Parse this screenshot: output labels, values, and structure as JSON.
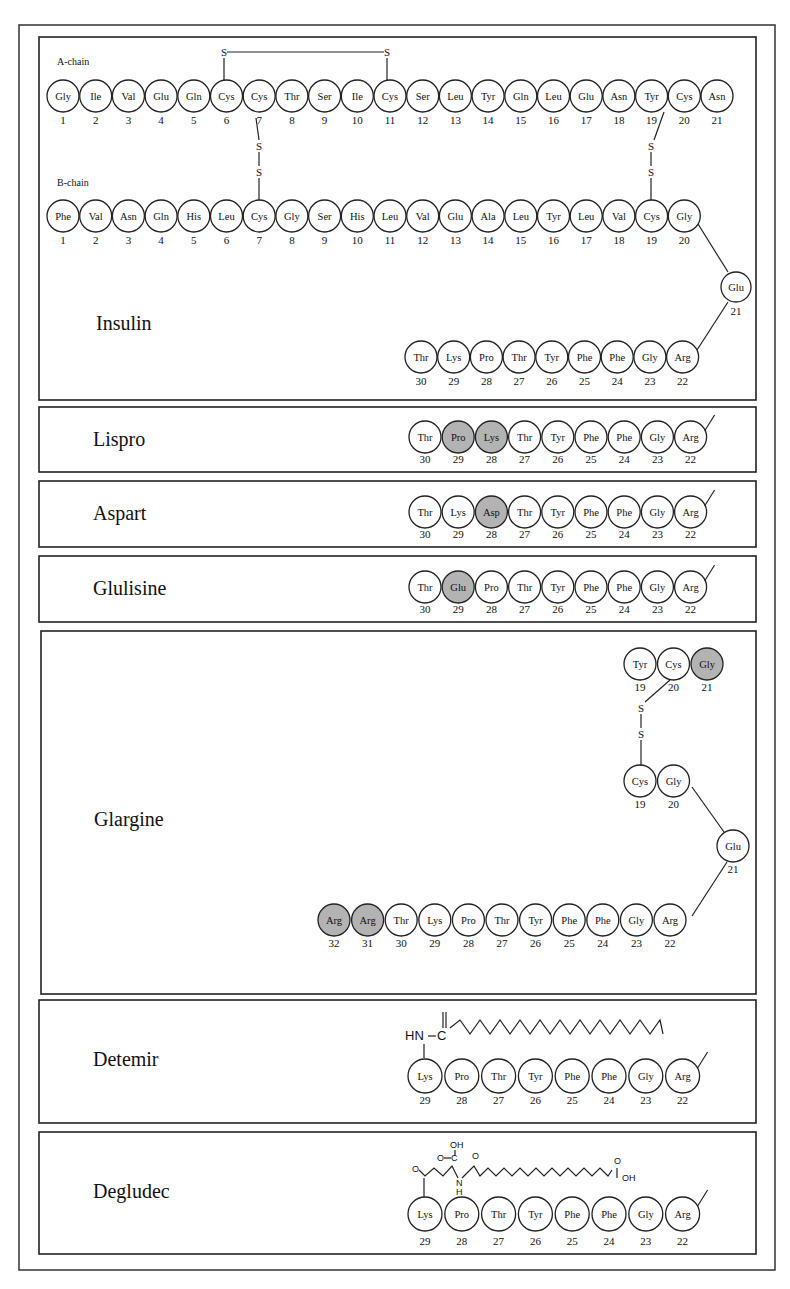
{
  "colors": {
    "modified_residue": "#b3b3b3",
    "residue": "#ffffff",
    "stroke": "#222222"
  },
  "insulin": {
    "name": "Insulin",
    "a_chain_label": "A-chain",
    "b_chain_label": "B-chain",
    "a_chain": [
      "Gly",
      "Ile",
      "Val",
      "Glu",
      "Gln",
      "Cys",
      "Cys",
      "Thr",
      "Ser",
      "Ile",
      "Cys",
      "Ser",
      "Leu",
      "Tyr",
      "Gln",
      "Leu",
      "Glu",
      "Asn",
      "Tyr",
      "Cys",
      "Asn"
    ],
    "b_chain_top": [
      "Phe",
      "Val",
      "Asn",
      "Gln",
      "His",
      "Leu",
      "Cys",
      "Gly",
      "Ser",
      "His",
      "Leu",
      "Val",
      "Glu",
      "Ala",
      "Leu",
      "Tyr",
      "Leu",
      "Val",
      "Cys",
      "Gly"
    ],
    "b_chain_turn": {
      "res": "Glu",
      "num": "21"
    },
    "b_chain_bottom": [
      {
        "res": "Thr",
        "num": "30"
      },
      {
        "res": "Lys",
        "num": "29"
      },
      {
        "res": "Pro",
        "num": "28"
      },
      {
        "res": "Thr",
        "num": "27"
      },
      {
        "res": "Tyr",
        "num": "26"
      },
      {
        "res": "Phe",
        "num": "25"
      },
      {
        "res": "Phe",
        "num": "24"
      },
      {
        "res": "Gly",
        "num": "23"
      },
      {
        "res": "Arg",
        "num": "22"
      }
    ],
    "disulfide_label": "S"
  },
  "analogs": [
    {
      "name": "Lispro",
      "residues": [
        {
          "res": "Thr",
          "num": "30"
        },
        {
          "res": "Pro",
          "num": "29",
          "mod": true
        },
        {
          "res": "Lys",
          "num": "28",
          "mod": true
        },
        {
          "res": "Thr",
          "num": "27"
        },
        {
          "res": "Tyr",
          "num": "26"
        },
        {
          "res": "Phe",
          "num": "25"
        },
        {
          "res": "Phe",
          "num": "24"
        },
        {
          "res": "Gly",
          "num": "23"
        },
        {
          "res": "Arg",
          "num": "22"
        }
      ]
    },
    {
      "name": "Aspart",
      "residues": [
        {
          "res": "Thr",
          "num": "30"
        },
        {
          "res": "Lys",
          "num": "29"
        },
        {
          "res": "Asp",
          "num": "28",
          "mod": true
        },
        {
          "res": "Thr",
          "num": "27"
        },
        {
          "res": "Tyr",
          "num": "26"
        },
        {
          "res": "Phe",
          "num": "25"
        },
        {
          "res": "Phe",
          "num": "24"
        },
        {
          "res": "Gly",
          "num": "23"
        },
        {
          "res": "Arg",
          "num": "22"
        }
      ]
    },
    {
      "name": "Glulisine",
      "residues": [
        {
          "res": "Thr",
          "num": "30"
        },
        {
          "res": "Glu",
          "num": "29",
          "mod": true
        },
        {
          "res": "Pro",
          "num": "28"
        },
        {
          "res": "Thr",
          "num": "27"
        },
        {
          "res": "Tyr",
          "num": "26"
        },
        {
          "res": "Phe",
          "num": "25"
        },
        {
          "res": "Phe",
          "num": "24"
        },
        {
          "res": "Gly",
          "num": "23"
        },
        {
          "res": "Arg",
          "num": "22"
        }
      ]
    }
  ],
  "glargine": {
    "name": "Glargine",
    "a_chain_end": [
      {
        "res": "Tyr",
        "num": "19"
      },
      {
        "res": "Cys",
        "num": "20"
      },
      {
        "res": "Gly",
        "num": "21",
        "mod": true
      }
    ],
    "b_chain_top": [
      {
        "res": "Cys",
        "num": "19"
      },
      {
        "res": "Gly",
        "num": "20"
      }
    ],
    "turn": {
      "res": "Glu",
      "num": "21"
    },
    "bottom": [
      {
        "res": "Arg",
        "num": "32",
        "mod": true
      },
      {
        "res": "Arg",
        "num": "31",
        "mod": true
      },
      {
        "res": "Thr",
        "num": "30"
      },
      {
        "res": "Lys",
        "num": "29"
      },
      {
        "res": "Pro",
        "num": "28"
      },
      {
        "res": "Thr",
        "num": "27"
      },
      {
        "res": "Tyr",
        "num": "26"
      },
      {
        "res": "Phe",
        "num": "25"
      },
      {
        "res": "Phe",
        "num": "24"
      },
      {
        "res": "Gly",
        "num": "23"
      },
      {
        "res": "Arg",
        "num": "22"
      }
    ]
  },
  "detemir": {
    "name": "Detemir",
    "chem": {
      "hn": "HN",
      "c": "C"
    },
    "residues": [
      {
        "res": "Lys",
        "num": "29"
      },
      {
        "res": "Pro",
        "num": "28"
      },
      {
        "res": "Thr",
        "num": "27"
      },
      {
        "res": "Tyr",
        "num": "26"
      },
      {
        "res": "Phe",
        "num": "25"
      },
      {
        "res": "Phe",
        "num": "24"
      },
      {
        "res": "Gly",
        "num": "23"
      },
      {
        "res": "Arg",
        "num": "22"
      }
    ]
  },
  "degludec": {
    "name": "Degludec",
    "chem": {
      "oh_top": "OH",
      "o_left": "O",
      "c": "C",
      "o_side": "O",
      "n": "N",
      "h": "H",
      "o_amide": "O",
      "o_acid": "O",
      "oh_end": "OH"
    },
    "residues": [
      {
        "res": "Lys",
        "num": "29"
      },
      {
        "res": "Pro",
        "num": "28"
      },
      {
        "res": "Thr",
        "num": "27"
      },
      {
        "res": "Tyr",
        "num": "26"
      },
      {
        "res": "Phe",
        "num": "25"
      },
      {
        "res": "Phe",
        "num": "24"
      },
      {
        "res": "Gly",
        "num": "23"
      },
      {
        "res": "Arg",
        "num": "22"
      }
    ]
  }
}
